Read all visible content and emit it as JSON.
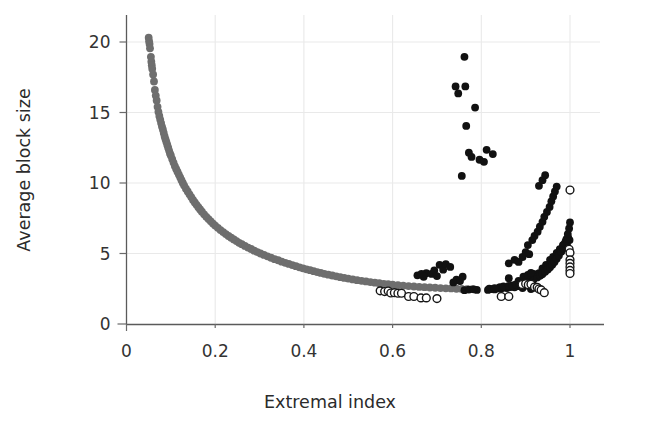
{
  "figure": {
    "background_color": "#ffffff",
    "width": 658,
    "height": 429
  },
  "axes": {
    "x_title": "Extremal index",
    "y_title": "Average block size",
    "x_ticks": [
      "0",
      "0.2",
      "0.4",
      "0.6",
      "0.8",
      "1"
    ],
    "y_ticks": [
      "0",
      "5",
      "10",
      "15",
      "20"
    ]
  },
  "colors": {
    "gray_series": "#6e6e6e",
    "black_series": "#111111",
    "open_series_stroke": "#161616",
    "open_series_fill": "#ffffff",
    "grid": "#e9e9e9",
    "axis": "#5a5a5a",
    "text": "#2b2b2b"
  },
  "chart_data": {
    "type": "scatter",
    "title": "",
    "subtitle": "",
    "xlabel": "Extremal index",
    "ylabel": "Average block size",
    "xlim": [
      0,
      1.04
    ],
    "ylim": [
      0,
      21.5
    ],
    "xticks": [
      0,
      0.2,
      0.4,
      0.6,
      0.8,
      1
    ],
    "yticks": [
      0,
      5,
      10,
      15,
      20
    ],
    "grid": true,
    "legend": "none",
    "annotations": [],
    "series": [
      {
        "name": "gray-branch",
        "marker": "filled-circle",
        "color": "#6e6e6e",
        "size": 4.6,
        "points": [
          [
            0.05,
            20.3
          ],
          [
            0.051,
            20.05
          ],
          [
            0.052,
            19.85
          ],
          [
            0.053,
            19.55
          ],
          [
            0.055,
            18.95
          ],
          [
            0.056,
            18.6
          ],
          [
            0.057,
            18.35
          ],
          [
            0.058,
            18.1
          ],
          [
            0.06,
            17.7
          ],
          [
            0.062,
            17.2
          ],
          [
            0.064,
            16.6
          ],
          [
            0.066,
            16.2
          ],
          [
            0.068,
            15.85
          ],
          [
            0.07,
            15.4
          ],
          [
            0.072,
            15.05
          ],
          [
            0.074,
            14.75
          ],
          [
            0.076,
            14.5
          ],
          [
            0.078,
            14.25
          ],
          [
            0.08,
            14.0
          ],
          [
            0.082,
            13.8
          ],
          [
            0.084,
            13.55
          ],
          [
            0.086,
            13.3
          ],
          [
            0.088,
            13.1
          ],
          [
            0.09,
            12.9
          ],
          [
            0.092,
            12.7
          ],
          [
            0.094,
            12.5
          ],
          [
            0.096,
            12.3
          ],
          [
            0.098,
            12.1
          ],
          [
            0.1,
            11.95
          ],
          [
            0.103,
            11.7
          ],
          [
            0.106,
            11.45
          ],
          [
            0.109,
            11.2
          ],
          [
            0.112,
            11.0
          ],
          [
            0.115,
            10.8
          ],
          [
            0.118,
            10.6
          ],
          [
            0.121,
            10.4
          ],
          [
            0.124,
            10.2
          ],
          [
            0.127,
            10.0
          ],
          [
            0.13,
            9.82
          ],
          [
            0.134,
            9.6
          ],
          [
            0.138,
            9.4
          ],
          [
            0.142,
            9.2
          ],
          [
            0.146,
            9.0
          ],
          [
            0.15,
            8.8
          ],
          [
            0.154,
            8.62
          ],
          [
            0.158,
            8.45
          ],
          [
            0.162,
            8.28
          ],
          [
            0.166,
            8.12
          ],
          [
            0.17,
            7.96
          ],
          [
            0.175,
            7.78
          ],
          [
            0.18,
            7.6
          ],
          [
            0.185,
            7.44
          ],
          [
            0.19,
            7.28
          ],
          [
            0.195,
            7.12
          ],
          [
            0.2,
            6.98
          ],
          [
            0.206,
            6.82
          ],
          [
            0.212,
            6.66
          ],
          [
            0.218,
            6.52
          ],
          [
            0.224,
            6.38
          ],
          [
            0.23,
            6.24
          ],
          [
            0.236,
            6.12
          ],
          [
            0.242,
            6.0
          ],
          [
            0.248,
            5.88
          ],
          [
            0.254,
            5.76
          ],
          [
            0.26,
            5.66
          ],
          [
            0.267,
            5.54
          ],
          [
            0.274,
            5.42
          ],
          [
            0.281,
            5.32
          ],
          [
            0.288,
            5.2
          ],
          [
            0.295,
            5.1
          ],
          [
            0.302,
            5.0
          ],
          [
            0.31,
            4.9
          ],
          [
            0.318,
            4.8
          ],
          [
            0.326,
            4.7
          ],
          [
            0.334,
            4.6
          ],
          [
            0.342,
            4.52
          ],
          [
            0.35,
            4.42
          ],
          [
            0.358,
            4.34
          ],
          [
            0.366,
            4.26
          ],
          [
            0.374,
            4.18
          ],
          [
            0.382,
            4.1
          ],
          [
            0.39,
            4.02
          ],
          [
            0.398,
            3.95
          ],
          [
            0.406,
            3.88
          ],
          [
            0.414,
            3.82
          ],
          [
            0.422,
            3.75
          ],
          [
            0.43,
            3.68
          ],
          [
            0.438,
            3.62
          ],
          [
            0.446,
            3.56
          ],
          [
            0.455,
            3.5
          ],
          [
            0.464,
            3.44
          ],
          [
            0.473,
            3.38
          ],
          [
            0.482,
            3.32
          ],
          [
            0.491,
            3.27
          ],
          [
            0.5,
            3.22
          ],
          [
            0.51,
            3.16
          ],
          [
            0.52,
            3.11
          ],
          [
            0.53,
            3.06
          ],
          [
            0.54,
            3.02
          ],
          [
            0.55,
            2.97
          ],
          [
            0.56,
            2.93
          ],
          [
            0.57,
            2.89
          ],
          [
            0.58,
            2.85
          ],
          [
            0.59,
            2.82
          ],
          [
            0.6,
            2.79
          ],
          [
            0.612,
            2.75
          ],
          [
            0.624,
            2.72
          ],
          [
            0.636,
            2.69
          ],
          [
            0.648,
            2.66
          ],
          [
            0.66,
            2.63
          ],
          [
            0.672,
            2.61
          ],
          [
            0.684,
            2.59
          ],
          [
            0.696,
            2.57
          ],
          [
            0.708,
            2.55
          ],
          [
            0.72,
            2.53
          ],
          [
            0.732,
            2.52
          ],
          [
            0.744,
            2.5
          ],
          [
            0.756,
            2.49
          ],
          [
            0.768,
            2.48
          ],
          [
            0.78,
            2.47
          ]
        ]
      },
      {
        "name": "black-branch",
        "marker": "filled-circle",
        "color": "#111111",
        "size": 4.6,
        "points": [
          [
            0.79,
            2.42
          ],
          [
            0.815,
            2.42
          ],
          [
            0.823,
            2.48
          ],
          [
            0.83,
            2.45
          ],
          [
            0.838,
            2.52
          ],
          [
            0.844,
            2.5
          ],
          [
            0.852,
            2.58
          ],
          [
            0.858,
            2.55
          ],
          [
            0.866,
            2.62
          ],
          [
            0.875,
            2.6
          ],
          [
            0.885,
            2.68
          ],
          [
            0.893,
            2.55
          ],
          [
            0.902,
            2.72
          ],
          [
            0.912,
            2.48
          ],
          [
            0.762,
            2.4
          ],
          [
            0.772,
            2.44
          ],
          [
            0.783,
            2.46
          ],
          [
            0.918,
            3.55
          ],
          [
            0.924,
            3.45
          ],
          [
            0.93,
            3.6
          ],
          [
            0.935,
            3.5
          ],
          [
            0.938,
            3.95
          ],
          [
            0.942,
            3.8
          ],
          [
            0.946,
            4.2
          ],
          [
            0.95,
            4.05
          ],
          [
            0.955,
            4.55
          ],
          [
            0.958,
            4.35
          ],
          [
            0.962,
            4.75
          ],
          [
            0.966,
            4.55
          ],
          [
            0.97,
            5.05
          ],
          [
            0.973,
            4.85
          ],
          [
            0.977,
            5.3
          ],
          [
            0.98,
            5.15
          ],
          [
            0.984,
            5.6
          ],
          [
            0.987,
            5.4
          ],
          [
            0.99,
            5.85
          ],
          [
            0.993,
            5.65
          ],
          [
            0.996,
            6.1
          ],
          [
            0.999,
            5.95
          ],
          [
            0.842,
            2.62
          ],
          [
            0.85,
            2.66
          ],
          [
            0.862,
            2.7
          ],
          [
            0.87,
            2.74
          ],
          [
            0.878,
            2.8
          ],
          [
            0.886,
            2.86
          ],
          [
            0.894,
            2.92
          ],
          [
            0.902,
            2.98
          ],
          [
            0.91,
            3.06
          ],
          [
            0.918,
            3.16
          ],
          [
            0.926,
            3.3
          ],
          [
            0.932,
            3.42
          ],
          [
            0.938,
            3.55
          ],
          [
            0.944,
            3.7
          ],
          [
            0.95,
            3.86
          ],
          [
            0.955,
            4.02
          ],
          [
            0.96,
            4.2
          ],
          [
            0.965,
            4.4
          ],
          [
            0.97,
            4.62
          ],
          [
            0.975,
            4.86
          ],
          [
            0.98,
            5.12
          ],
          [
            0.984,
            5.4
          ],
          [
            0.988,
            5.7
          ],
          [
            0.992,
            6.02
          ],
          [
            0.995,
            6.38
          ],
          [
            0.998,
            6.78
          ],
          [
            1.0,
            7.2
          ],
          [
            0.818,
            2.5
          ],
          [
            0.83,
            2.55
          ],
          [
            0.862,
            3.25
          ],
          [
            0.884,
            3.05
          ],
          [
            0.895,
            3.35
          ],
          [
            0.905,
            3.48
          ],
          [
            0.912,
            3.62
          ],
          [
            0.862,
            4.3
          ],
          [
            0.875,
            4.55
          ],
          [
            0.884,
            4.4
          ],
          [
            0.893,
            4.75
          ],
          [
            0.9,
            5.1
          ],
          [
            0.908,
            4.95
          ],
          [
            0.905,
            5.6
          ],
          [
            0.915,
            5.95
          ],
          [
            0.92,
            6.25
          ],
          [
            0.927,
            6.55
          ],
          [
            0.932,
            6.9
          ],
          [
            0.938,
            7.25
          ],
          [
            0.942,
            7.6
          ],
          [
            0.948,
            7.95
          ],
          [
            0.954,
            8.3
          ],
          [
            0.958,
            8.7
          ],
          [
            0.962,
            9.05
          ],
          [
            0.966,
            9.4
          ],
          [
            0.97,
            9.75
          ],
          [
            0.93,
            9.8
          ],
          [
            0.938,
            10.2
          ],
          [
            0.944,
            10.55
          ],
          [
            0.762,
            18.95
          ],
          [
            0.742,
            16.85
          ],
          [
            0.748,
            16.35
          ],
          [
            0.764,
            16.85
          ],
          [
            0.786,
            15.35
          ],
          [
            0.766,
            14.05
          ],
          [
            0.772,
            12.15
          ],
          [
            0.778,
            11.85
          ],
          [
            0.812,
            12.35
          ],
          [
            0.826,
            12.05
          ],
          [
            0.796,
            11.65
          ],
          [
            0.806,
            11.5
          ],
          [
            0.756,
            10.5
          ],
          [
            0.706,
            4.2
          ],
          [
            0.714,
            3.85
          ],
          [
            0.72,
            4.25
          ],
          [
            0.73,
            4.05
          ],
          [
            0.676,
            3.6
          ],
          [
            0.688,
            3.55
          ],
          [
            0.694,
            3.8
          ],
          [
            0.7,
            3.4
          ],
          [
            0.656,
            3.45
          ],
          [
            0.665,
            3.55
          ],
          [
            0.67,
            3.35
          ],
          [
            0.737,
            2.95
          ],
          [
            0.744,
            3.15
          ],
          [
            0.752,
            3.05
          ],
          [
            0.758,
            3.35
          ]
        ]
      },
      {
        "name": "open-branch",
        "marker": "open-circle",
        "color": "#161616",
        "size": 4.6,
        "points": [
          [
            0.572,
            2.35
          ],
          [
            0.582,
            2.3
          ],
          [
            0.59,
            2.34
          ],
          [
            0.596,
            2.2
          ],
          [
            0.604,
            2.22
          ],
          [
            0.612,
            2.18
          ],
          [
            0.62,
            2.18
          ],
          [
            0.636,
            1.95
          ],
          [
            0.648,
            1.95
          ],
          [
            0.664,
            1.85
          ],
          [
            0.676,
            1.85
          ],
          [
            0.7,
            1.8
          ],
          [
            0.845,
            1.95
          ],
          [
            0.862,
            1.95
          ],
          [
            0.892,
            2.8
          ],
          [
            0.9,
            2.85
          ],
          [
            0.906,
            2.78
          ],
          [
            0.912,
            2.82
          ],
          [
            0.92,
            2.62
          ],
          [
            0.926,
            2.6
          ],
          [
            0.93,
            2.48
          ],
          [
            0.935,
            2.42
          ],
          [
            0.942,
            2.22
          ],
          [
            1.0,
            9.5
          ],
          [
            0.998,
            5.3
          ],
          [
            1.0,
            5.05
          ],
          [
            1.0,
            4.55
          ],
          [
            1.0,
            4.3
          ],
          [
            1.0,
            4.05
          ],
          [
            1.0,
            3.8
          ],
          [
            1.0,
            3.58
          ]
        ]
      }
    ]
  }
}
